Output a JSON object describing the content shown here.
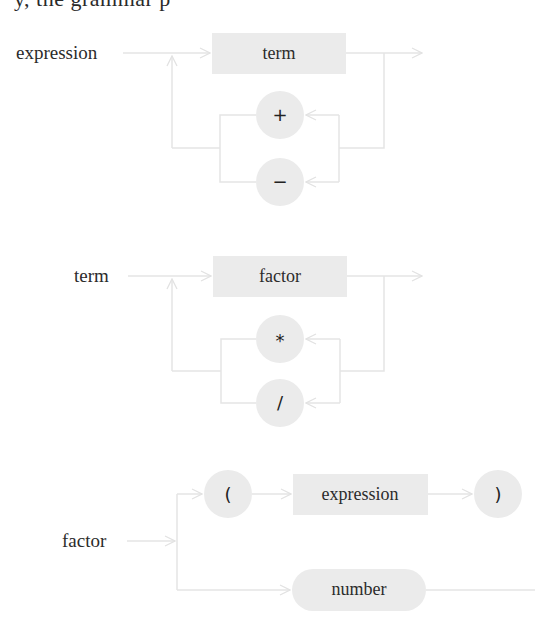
{
  "header": {
    "clipped_text": "y,  the  grammar  p"
  },
  "colors": {
    "node_fill": "#ebebeb",
    "wire": "#e5e5e5",
    "text": "#2b2b2b",
    "background": "#ffffff"
  },
  "diagrams": [
    {
      "rule": "expression",
      "label": {
        "text": "expression",
        "x": 16,
        "y": 59
      },
      "nodes": [
        {
          "id": "term",
          "kind": "nonterminal",
          "text": "term",
          "x": 212,
          "y": 33,
          "w": 134,
          "h": 41
        },
        {
          "id": "plus",
          "kind": "terminal",
          "text": "+",
          "cx": 280,
          "cy": 115,
          "r": 24
        },
        {
          "id": "minus",
          "kind": "terminal",
          "text": "−",
          "cx": 280,
          "cy": 182,
          "r": 24
        }
      ]
    },
    {
      "rule": "term",
      "label": {
        "text": "term",
        "x": 74,
        "y": 282
      },
      "nodes": [
        {
          "id": "factor",
          "kind": "nonterminal",
          "text": "factor",
          "x": 213,
          "y": 256,
          "w": 134,
          "h": 41
        },
        {
          "id": "times",
          "kind": "terminal",
          "text": "*",
          "cx": 280,
          "cy": 339,
          "r": 24
        },
        {
          "id": "divide",
          "kind": "terminal",
          "text": "/",
          "cx": 280,
          "cy": 403,
          "r": 24
        }
      ]
    },
    {
      "rule": "factor",
      "label": {
        "text": "factor",
        "x": 62,
        "y": 547
      },
      "nodes": [
        {
          "id": "lparen",
          "kind": "terminal",
          "text": "(",
          "cx": 228,
          "cy": 494,
          "r": 24
        },
        {
          "id": "expression",
          "kind": "nonterminal",
          "text": "expression",
          "x": 293,
          "y": 474,
          "w": 135,
          "h": 41
        },
        {
          "id": "rparen",
          "kind": "terminal",
          "text": ")",
          "cx": 498,
          "cy": 494,
          "r": 24
        },
        {
          "id": "number",
          "kind": "token",
          "text": "number",
          "x": 292,
          "y": 569,
          "w": 134,
          "h": 42
        }
      ]
    }
  ]
}
